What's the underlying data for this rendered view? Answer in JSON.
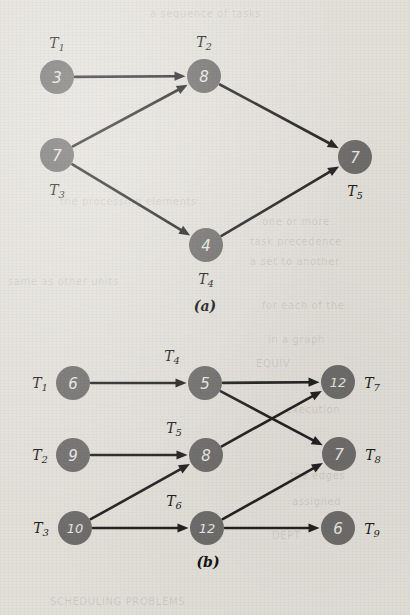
{
  "page": {
    "background_color": "#e2dfd9",
    "node_color": "#6f6d6b",
    "node_text_color": "#e8e6e2",
    "edge_color": "#232323",
    "label_color": "#1d1d1d"
  },
  "figures": [
    {
      "id": "figure-a",
      "caption": "(a)",
      "caption_pos": {
        "x": 205,
        "y": 306
      },
      "node_radius": 17,
      "nodes": [
        {
          "id": "a-t1",
          "task": "T",
          "index": "1",
          "value": "3",
          "cx": 57,
          "cy": 77,
          "label_x": 57,
          "label_y": 43,
          "label_pos": "above"
        },
        {
          "id": "a-t2",
          "task": "T",
          "index": "2",
          "value": "8",
          "cx": 204,
          "cy": 76,
          "label_x": 204,
          "label_y": 42,
          "label_pos": "above"
        },
        {
          "id": "a-t3",
          "task": "T",
          "index": "3",
          "value": "7",
          "cx": 57,
          "cy": 155,
          "label_x": 57,
          "label_y": 190,
          "label_pos": "below"
        },
        {
          "id": "a-t4",
          "task": "T",
          "index": "4",
          "value": "4",
          "cx": 206,
          "cy": 245,
          "label_x": 206,
          "label_y": 279,
          "label_pos": "below"
        },
        {
          "id": "a-t5",
          "task": "T",
          "index": "5",
          "value": "7",
          "cx": 355,
          "cy": 157,
          "label_x": 355,
          "label_y": 191,
          "label_pos": "below"
        }
      ],
      "edges": [
        {
          "id": "a-e1",
          "from": "a-t1",
          "to": "a-t2"
        },
        {
          "id": "a-e2",
          "from": "a-t3",
          "to": "a-t2"
        },
        {
          "id": "a-e3",
          "from": "a-t3",
          "to": "a-t4"
        },
        {
          "id": "a-e4",
          "from": "a-t2",
          "to": "a-t5"
        },
        {
          "id": "a-e5",
          "from": "a-t4",
          "to": "a-t5"
        }
      ]
    },
    {
      "id": "figure-b",
      "caption": "(b)",
      "caption_pos": {
        "x": 208,
        "y": 562
      },
      "node_radius": 17,
      "nodes": [
        {
          "id": "b-t1",
          "task": "T",
          "index": "1",
          "value": "6",
          "cx": 73,
          "cy": 383,
          "label_x": 40,
          "label_y": 383,
          "label_pos": "left"
        },
        {
          "id": "b-t2",
          "task": "T",
          "index": "2",
          "value": "9",
          "cx": 73,
          "cy": 455,
          "label_x": 40,
          "label_y": 455,
          "label_pos": "left"
        },
        {
          "id": "b-t3",
          "task": "T",
          "index": "3",
          "value": "10",
          "cx": 75,
          "cy": 528,
          "label_x": 41,
          "label_y": 528,
          "label_pos": "left"
        },
        {
          "id": "b-t4",
          "task": "T",
          "index": "4",
          "value": "5",
          "cx": 205,
          "cy": 383,
          "label_x": 172,
          "label_y": 356,
          "label_pos": "above-left"
        },
        {
          "id": "b-t5",
          "task": "T",
          "index": "5",
          "value": "8",
          "cx": 206,
          "cy": 455,
          "label_x": 174,
          "label_y": 428,
          "label_pos": "above-left"
        },
        {
          "id": "b-t6",
          "task": "T",
          "index": "6",
          "value": "12",
          "cx": 207,
          "cy": 528,
          "label_x": 174,
          "label_y": 501,
          "label_pos": "above-left"
        },
        {
          "id": "b-t7",
          "task": "T",
          "index": "7",
          "value": "12",
          "cx": 338,
          "cy": 382,
          "label_x": 372,
          "label_y": 383,
          "label_pos": "right"
        },
        {
          "id": "b-t8",
          "task": "T",
          "index": "8",
          "value": "7",
          "cx": 339,
          "cy": 454,
          "label_x": 373,
          "label_y": 455,
          "label_pos": "right"
        },
        {
          "id": "b-t9",
          "task": "T",
          "index": "9",
          "value": "6",
          "cx": 338,
          "cy": 528,
          "label_x": 372,
          "label_y": 529,
          "label_pos": "right"
        }
      ],
      "edges": [
        {
          "id": "b-e1",
          "from": "b-t1",
          "to": "b-t4"
        },
        {
          "id": "b-e2",
          "from": "b-t2",
          "to": "b-t5"
        },
        {
          "id": "b-e3",
          "from": "b-t3",
          "to": "b-t5"
        },
        {
          "id": "b-e4",
          "from": "b-t3",
          "to": "b-t6"
        },
        {
          "id": "b-e5",
          "from": "b-t4",
          "to": "b-t7"
        },
        {
          "id": "b-e6",
          "from": "b-t4",
          "to": "b-t8"
        },
        {
          "id": "b-e7",
          "from": "b-t5",
          "to": "b-t7"
        },
        {
          "id": "b-e8",
          "from": "b-t6",
          "to": "b-t8"
        },
        {
          "id": "b-e9",
          "from": "b-t6",
          "to": "b-t9"
        }
      ]
    }
  ],
  "bleed_text": [
    {
      "text": "a sequence of tasks",
      "x": 150,
      "y": 8
    },
    {
      "text": "the processing elements",
      "x": 60,
      "y": 196
    },
    {
      "text": "one or more",
      "x": 262,
      "y": 216
    },
    {
      "text": "task precedence",
      "x": 250,
      "y": 236
    },
    {
      "text": "a set to another",
      "x": 250,
      "y": 256
    },
    {
      "text": "same as other units",
      "x": 8,
      "y": 276
    },
    {
      "text": "for each of the",
      "x": 262,
      "y": 300
    },
    {
      "text": "in a graph",
      "x": 268,
      "y": 334
    },
    {
      "text": "EQUIV",
      "x": 256,
      "y": 358
    },
    {
      "text": "execution",
      "x": 286,
      "y": 404
    },
    {
      "text": "the edges",
      "x": 290,
      "y": 470
    },
    {
      "text": "assigned",
      "x": 292,
      "y": 496
    },
    {
      "text": "DEPT",
      "x": 272,
      "y": 530
    },
    {
      "text": "SCHEDULING PROBLEMS",
      "x": 50,
      "y": 596
    }
  ]
}
